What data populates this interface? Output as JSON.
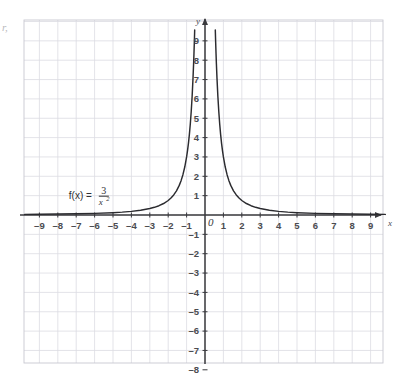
{
  "chart_data": {
    "type": "line",
    "title": "",
    "subtitle": "",
    "xlabel": "x",
    "ylabel": "y",
    "xlim": [
      -9.8,
      9.8
    ],
    "ylim": [
      -8.5,
      9.6
    ],
    "grid": true,
    "legend_position": "none",
    "annotations": [
      {
        "name": "function-equation",
        "text": "f(x) = 3/x^2",
        "lhs": "f(x) =",
        "numerator": "3",
        "denominator_base": "x",
        "denominator_exponent": "2",
        "x": -7.4,
        "y": 1.05
      }
    ],
    "x_tick_labels": [
      "-9",
      "-8",
      "-7",
      "-6",
      "-5",
      "-4",
      "-3",
      "-2",
      "-1",
      "1",
      "2",
      "3",
      "4",
      "5",
      "6",
      "7",
      "8",
      "9"
    ],
    "x_tick_values": [
      -9,
      -8,
      -7,
      -6,
      -5,
      -4,
      -3,
      -2,
      -1,
      1,
      2,
      3,
      4,
      5,
      6,
      7,
      8,
      9
    ],
    "y_tick_labels": [
      "9",
      "8",
      "7",
      "6",
      "5",
      "4",
      "3",
      "2",
      "1",
      "-1",
      "-2",
      "-3",
      "-4",
      "-5",
      "-6",
      "-7",
      "-8"
    ],
    "y_tick_values": [
      9,
      8,
      7,
      6,
      5,
      4,
      3,
      2,
      1,
      -1,
      -2,
      -3,
      -4,
      -5,
      -6,
      -7,
      -8
    ],
    "origin_label": "0",
    "series": [
      {
        "name": "f(x) = 3/x^2",
        "color": "#2b2b2f",
        "equation_a": 3,
        "equation_exponent": 2,
        "left_branch": [
          [
            -9.8,
            0.0312
          ],
          [
            -9.0,
            0.037
          ],
          [
            -8.0,
            0.0469
          ],
          [
            -7.0,
            0.0612
          ],
          [
            -6.0,
            0.0833
          ],
          [
            -5.0,
            0.12
          ],
          [
            -4.5,
            0.1481
          ],
          [
            -4.0,
            0.1875
          ],
          [
            -3.5,
            0.2449
          ],
          [
            -3.0,
            0.3333
          ],
          [
            -2.75,
            0.3967
          ],
          [
            -2.5,
            0.48
          ],
          [
            -2.25,
            0.5926
          ],
          [
            -2.0,
            0.75
          ],
          [
            -1.85,
            0.8766
          ],
          [
            -1.7,
            1.0381
          ],
          [
            -1.55,
            1.2487
          ],
          [
            -1.4,
            1.5306
          ],
          [
            -1.3,
            1.7751
          ],
          [
            -1.2,
            2.0833
          ],
          [
            -1.1,
            2.4793
          ],
          [
            -1.0,
            3.0
          ],
          [
            -0.95,
            3.3241
          ],
          [
            -0.9,
            3.7037
          ],
          [
            -0.85,
            4.1523
          ],
          [
            -0.8,
            4.6875
          ],
          [
            -0.75,
            5.3333
          ],
          [
            -0.7,
            6.1224
          ],
          [
            -0.65,
            7.1006
          ],
          [
            -0.62,
            7.8044
          ],
          [
            -0.6,
            8.3333
          ],
          [
            -0.58,
            8.918
          ],
          [
            -0.56,
            9.5663
          ]
        ],
        "right_branch": [
          [
            0.56,
            9.5663
          ],
          [
            0.58,
            8.918
          ],
          [
            0.6,
            8.3333
          ],
          [
            0.62,
            7.8044
          ],
          [
            0.65,
            7.1006
          ],
          [
            0.7,
            6.1224
          ],
          [
            0.75,
            5.3333
          ],
          [
            0.8,
            4.6875
          ],
          [
            0.85,
            4.1523
          ],
          [
            0.9,
            3.7037
          ],
          [
            0.95,
            3.3241
          ],
          [
            1.0,
            3.0
          ],
          [
            1.1,
            2.4793
          ],
          [
            1.2,
            2.0833
          ],
          [
            1.3,
            1.7751
          ],
          [
            1.4,
            1.5306
          ],
          [
            1.55,
            1.2487
          ],
          [
            1.7,
            1.0381
          ],
          [
            1.85,
            0.8766
          ],
          [
            2.0,
            0.75
          ],
          [
            2.25,
            0.5926
          ],
          [
            2.5,
            0.48
          ],
          [
            2.75,
            0.3967
          ],
          [
            3.0,
            0.3333
          ],
          [
            3.5,
            0.2449
          ],
          [
            4.0,
            0.1875
          ],
          [
            4.5,
            0.1481
          ],
          [
            5.0,
            0.12
          ],
          [
            6.0,
            0.0833
          ],
          [
            7.0,
            0.0612
          ],
          [
            8.0,
            0.0469
          ],
          [
            9.0,
            0.037
          ],
          [
            9.8,
            0.0312
          ]
        ]
      }
    ],
    "colors": {
      "curve": "#2b2b2f",
      "axis": "#3a3a3e",
      "gridline": "#dcdce2",
      "gridline_major": "#c8c8d0",
      "tick_text": "#4c4c50",
      "background": "#ffffff"
    }
  },
  "artifact": {
    "edge_mark": "r,"
  }
}
